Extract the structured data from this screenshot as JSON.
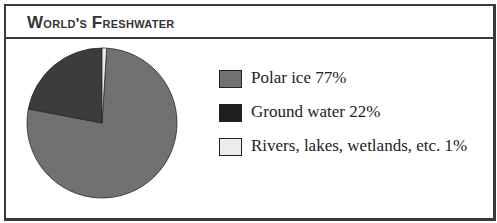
{
  "header": {
    "title": "World's Freshwater"
  },
  "legend": [
    {
      "label": "Polar ice 77%",
      "color": "#717171"
    },
    {
      "label": "Ground water 22%",
      "color": "#1e1e1e"
    },
    {
      "label": "Rivers, lakes, wetlands, etc. 1%",
      "color": "#ececec"
    }
  ],
  "chart_data": {
    "type": "pie",
    "title": "World's Freshwater",
    "categories": [
      "Polar ice",
      "Ground water",
      "Rivers, lakes, wetlands, etc."
    ],
    "values": [
      77,
      22,
      1
    ],
    "unit": "%",
    "colors": [
      "#717171",
      "#3c3c3c",
      "#ececec"
    ],
    "legend_position": "right"
  }
}
